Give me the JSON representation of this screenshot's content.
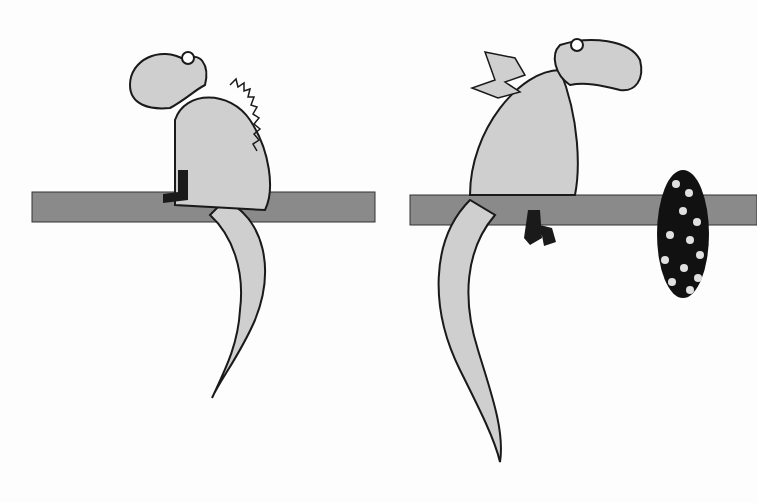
{
  "scene": {
    "description": "Two cartoon dragons sitting on tree branches",
    "colors": {
      "background": "#fdfdfd",
      "dragon_fill": "#cfcfcf",
      "outline": "#1a1a1a",
      "branch": "#8a8a8a",
      "egg": "#111111",
      "egg_spots": "#e0e0e0"
    },
    "panels": [
      {
        "id": "left",
        "subject": "dragon-sitting-with-boot"
      },
      {
        "id": "right",
        "subject": "winged-dragon-with-spotted-egg"
      }
    ]
  }
}
